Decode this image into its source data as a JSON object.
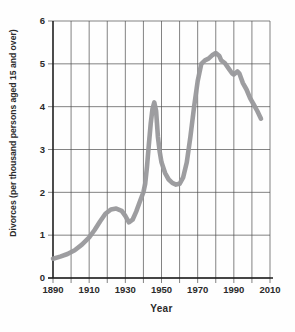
{
  "chart_data": {
    "type": "line",
    "title": "",
    "xlabel": "Year",
    "ylabel": "Divorces (per thousand persons aged 15 and over)",
    "xlim": [
      1890,
      2010
    ],
    "ylim": [
      0,
      6
    ],
    "grid": true,
    "x_gridline_step": 10,
    "y_gridline_step": 1,
    "x_tick_labels": [
      "1890",
      "1910",
      "1930",
      "1950",
      "1970",
      "1990",
      "2010"
    ],
    "y_tick_labels": [
      "0",
      "1",
      "2",
      "3",
      "4",
      "5",
      "6"
    ],
    "line_color": "#98989b",
    "grid_color": "#4d4d4d",
    "axis_color": "#1c1c1c",
    "text_color": "#2a2a2a",
    "legend": "none",
    "series": [
      {
        "name": "Divorce rate per thousand persons aged 15 and over",
        "points": [
          [
            1890,
            0.45
          ],
          [
            1894,
            0.5
          ],
          [
            1898,
            0.56
          ],
          [
            1902,
            0.65
          ],
          [
            1906,
            0.78
          ],
          [
            1910,
            0.95
          ],
          [
            1913,
            1.12
          ],
          [
            1916,
            1.32
          ],
          [
            1919,
            1.5
          ],
          [
            1922,
            1.6
          ],
          [
            1925,
            1.62
          ],
          [
            1928,
            1.57
          ],
          [
            1930,
            1.45
          ],
          [
            1932,
            1.3
          ],
          [
            1934,
            1.36
          ],
          [
            1936,
            1.55
          ],
          [
            1938,
            1.78
          ],
          [
            1940,
            2.0
          ],
          [
            1941,
            2.2
          ],
          [
            1942,
            2.6
          ],
          [
            1943,
            3.1
          ],
          [
            1944,
            3.6
          ],
          [
            1945,
            3.95
          ],
          [
            1946,
            4.1
          ],
          [
            1947,
            3.9
          ],
          [
            1948,
            3.3
          ],
          [
            1949,
            2.95
          ],
          [
            1950,
            2.7
          ],
          [
            1952,
            2.45
          ],
          [
            1954,
            2.3
          ],
          [
            1956,
            2.22
          ],
          [
            1958,
            2.18
          ],
          [
            1960,
            2.2
          ],
          [
            1962,
            2.35
          ],
          [
            1964,
            2.7
          ],
          [
            1966,
            3.3
          ],
          [
            1968,
            4.0
          ],
          [
            1970,
            4.6
          ],
          [
            1972,
            5.0
          ],
          [
            1974,
            5.08
          ],
          [
            1976,
            5.12
          ],
          [
            1978,
            5.2
          ],
          [
            1980,
            5.25
          ],
          [
            1982,
            5.18
          ],
          [
            1983,
            5.08
          ],
          [
            1985,
            5.02
          ],
          [
            1987,
            4.9
          ],
          [
            1989,
            4.78
          ],
          [
            1990,
            4.75
          ],
          [
            1992,
            4.82
          ],
          [
            1993,
            4.78
          ],
          [
            1995,
            4.55
          ],
          [
            1997,
            4.4
          ],
          [
            1999,
            4.2
          ],
          [
            2001,
            4.05
          ],
          [
            2003,
            3.9
          ],
          [
            2005,
            3.72
          ]
        ]
      }
    ]
  }
}
